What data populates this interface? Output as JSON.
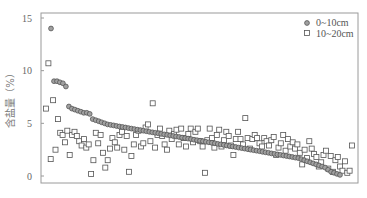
{
  "chart_data": {
    "type": "scatter",
    "title": "",
    "xlabel": "",
    "ylabel": "含盐量（%）",
    "ylim": [
      0,
      15
    ],
    "yticks": [
      0,
      5,
      10,
      15
    ],
    "grid": false,
    "legend_position": "top-right",
    "series": [
      {
        "name": "0~10cm",
        "marker": "circle",
        "values": [
          14.0,
          9.0,
          9.0,
          8.9,
          8.8,
          8.5,
          6.6,
          6.4,
          6.3,
          6.2,
          6.1,
          6.0,
          6.0,
          5.9,
          5.4,
          5.3,
          5.2,
          5.1,
          5.0,
          4.9,
          4.85,
          4.8,
          4.75,
          4.7,
          4.65,
          4.6,
          4.55,
          4.5,
          4.45,
          4.4,
          4.35,
          4.3,
          4.25,
          4.2,
          4.15,
          4.1,
          4.05,
          4.0,
          3.95,
          3.9,
          3.85,
          3.8,
          3.75,
          3.7,
          3.65,
          3.6,
          3.55,
          3.5,
          3.45,
          3.4,
          3.35,
          3.3,
          3.25,
          3.2,
          3.15,
          3.1,
          3.05,
          3.0,
          2.95,
          2.9,
          2.85,
          2.8,
          2.75,
          2.7,
          2.65,
          2.6,
          2.55,
          2.5,
          2.45,
          2.4,
          2.35,
          2.3,
          2.25,
          2.2,
          2.15,
          2.1,
          2.05,
          2.0,
          1.95,
          1.9,
          1.85,
          1.8,
          1.75,
          1.7,
          1.6,
          1.5,
          1.4,
          1.3,
          1.2,
          1.1,
          1.0,
          0.9,
          0.8,
          0.6,
          0.4,
          0.3,
          0.2,
          0.1
        ]
      },
      {
        "name": "10~20cm",
        "marker": "square",
        "values": [
          6.4,
          10.7,
          1.6,
          7.2,
          2.5,
          5.4,
          4.1,
          3.9,
          3.2,
          4.3,
          2.0,
          3.9,
          4.2,
          3.8,
          3.3,
          2.9,
          3.5,
          2.7,
          3.0,
          0.2,
          1.5,
          4.1,
          3.1,
          3.9,
          2.2,
          0.8,
          1.5,
          2.6,
          3.6,
          3.2,
          2.7,
          3.9,
          4.2,
          2.5,
          3.8,
          0.4,
          1.9,
          3.0,
          3.9,
          4.3,
          2.8,
          3.1,
          4.6,
          4.9,
          3.3,
          6.9,
          2.7,
          3.9,
          4.5,
          3.8,
          3.0,
          2.5,
          4.3,
          3.5,
          4.0,
          4.4,
          3.0,
          4.5,
          3.6,
          2.8,
          4.0,
          4.5,
          3.2,
          4.2,
          4.5,
          3.3,
          2.8,
          0.3,
          3.4,
          4.5,
          3.6,
          2.7,
          3.9,
          4.4,
          2.8,
          3.4,
          4.2,
          3.8,
          2.9,
          2.0,
          3.5,
          4.2,
          3.5,
          3.0,
          5.5,
          3.6,
          2.6,
          3.5,
          3.9,
          3.6,
          3.1,
          2.8,
          3.6,
          3.3,
          2.9,
          3.4,
          3.7,
          2.0,
          2.7,
          3.1,
          3.9,
          2.4,
          3.5,
          2.8,
          3.2,
          2.6,
          3.0,
          2.2,
          1.1,
          2.5,
          1.7,
          3.3,
          2.6,
          2.1,
          1.8,
          0.9,
          1.3,
          2.0,
          2.4,
          0.7,
          1.9,
          0.4,
          1.5,
          1.8,
          0.9,
          0.5,
          1.4,
          0.3,
          0.5,
          2.9
        ]
      }
    ]
  },
  "legend": {
    "items": [
      {
        "label": "0~10cm",
        "marker": "circle"
      },
      {
        "label": "10~20cm",
        "marker": "square"
      }
    ]
  },
  "axis": {
    "ylabel": "含盐量（%）",
    "ytick_labels": [
      "0",
      "5",
      "10",
      "15"
    ]
  },
  "colors": {
    "marker_stroke": "#555555",
    "circle_fill": "#a0a0a0",
    "frame": "#999999",
    "text": "#666666"
  }
}
